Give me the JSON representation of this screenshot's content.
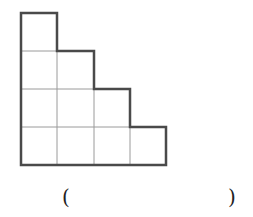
{
  "figure": {
    "column_heights": [
      4,
      3,
      2,
      1
    ],
    "cell_size": 36.5,
    "origin": [
      21,
      13
    ],
    "grid_color": "#9a9a9a",
    "outline_color": "#4a4a4a"
  },
  "answer": {
    "open_paren": "(",
    "close_paren": ")",
    "blank": ""
  }
}
